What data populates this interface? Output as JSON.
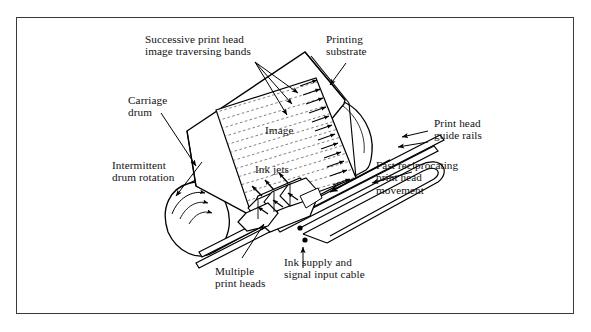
{
  "figure": {
    "border_color": "#3a3a3a",
    "background_color": "#ffffff",
    "line_color": "#000000"
  },
  "labels": {
    "successive_bands": "Successive print head\nimage traversing bands",
    "printing_substrate": "Printing\nsubstrate",
    "carriage_drum": "Carriage\ndrum",
    "intermittent_rotation": "Intermittent\ndrum rotation",
    "image": "Image",
    "ink_jets": "Ink jets",
    "print_head_guide_rails": "Print head\nguide rails",
    "fast_reciprocating": "Fast reciprocating\nprint head\nmovement",
    "multiple_print_heads": "Multiple\nprint heads",
    "ink_supply_cable": "Ink supply and\nsignal input cable"
  },
  "parts": [
    {
      "name": "carriage-drum",
      "shape": "cylinder"
    },
    {
      "name": "printing-substrate",
      "shape": "sheet"
    },
    {
      "name": "image-area",
      "shape": "scan-band-field"
    },
    {
      "name": "print-head-assembly",
      "shape": "multi-block"
    },
    {
      "name": "guide-rails",
      "shape": "twin-rails"
    },
    {
      "name": "cable-loop",
      "shape": "u-loop"
    },
    {
      "name": "ink-jets",
      "shape": "spray-arrows"
    }
  ]
}
